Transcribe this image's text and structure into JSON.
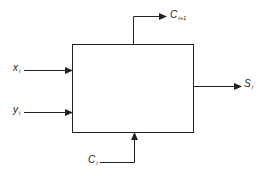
{
  "diagram": {
    "type": "block-diagram",
    "block": {
      "label": "",
      "x": 72,
      "y": 44,
      "width": 121,
      "height": 88
    },
    "colors": {
      "stroke": "#222222",
      "background": "#ffffff",
      "text": "#222222"
    },
    "inputs": [
      {
        "id": "x",
        "symbol": "x",
        "subscript": "i"
      },
      {
        "id": "y",
        "symbol": "y",
        "subscript": "i"
      },
      {
        "id": "c_in",
        "symbol": "C",
        "subscript": "i"
      }
    ],
    "outputs": [
      {
        "id": "sum",
        "symbol": "S",
        "subscript": "i"
      },
      {
        "id": "c_out",
        "symbol": "C",
        "subscript": "i+1"
      }
    ]
  }
}
